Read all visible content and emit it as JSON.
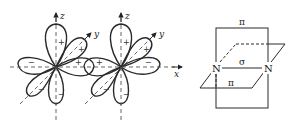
{
  "figure": {
    "left_panel": {
      "description": "Two p-orbitals (lobed d-like drawings) overlapping along x-axis",
      "axes": {
        "x_label": "x",
        "y_label": "y",
        "z_label": "z"
      },
      "orbital_1": {
        "signs": {
          "top": "+",
          "upper_right": "+",
          "right": "+",
          "left": "−",
          "lower_left": "−",
          "bottom": "−"
        }
      },
      "orbital_2": {
        "signs": {
          "top": "+",
          "upper_right": "+",
          "left": "+",
          "right": "−",
          "lower_left": "−",
          "bottom": "−"
        }
      }
    },
    "right_panel": {
      "description": "N≡N bonding: one sigma bond and two perpendicular pi planes",
      "atom_left": "N",
      "atom_right": "N",
      "sigma_label": "σ",
      "pi_label_vertical": "π",
      "pi_label_horizontal": "π"
    }
  },
  "colors": {
    "stroke": "#2a2a2a",
    "axis": "#555555",
    "background": "#ffffff"
  }
}
